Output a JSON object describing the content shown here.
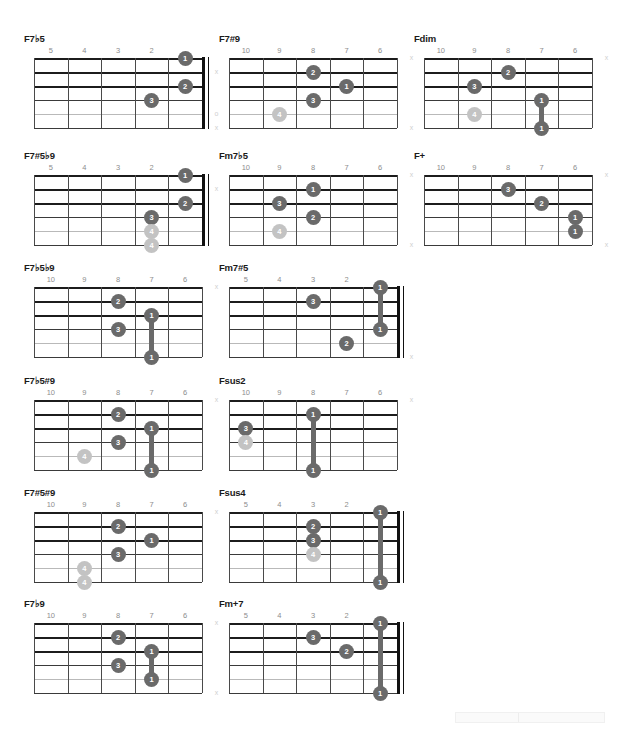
{
  "page": {
    "width": 627,
    "height": 729,
    "background": "#ffffff",
    "dot_color": "#6a6a6a",
    "dot_light_color": "#c3c3c3",
    "line_color": "#3a3a3a",
    "fretnum_color": "#8d8d8d",
    "marker_color": "#cfcfcf"
  },
  "legend": {
    "muted_symbol": "x",
    "open_symbol": "o"
  },
  "chords": [
    {
      "name": "F7♭5",
      "col": 0,
      "row": 0,
      "frets": [
        "5",
        "4",
        "3",
        "2",
        ""
      ],
      "has_nut": true,
      "dots": [
        {
          "string": 1,
          "fret_slot": 4,
          "label": "1",
          "light": false
        },
        {
          "string": 3,
          "fret_slot": 4,
          "label": "2",
          "light": false
        },
        {
          "string": 4,
          "fret_slot": 3,
          "label": "3",
          "light": false
        }
      ],
      "barres": [],
      "markers": [
        {
          "string": 2,
          "symbol": "x"
        },
        {
          "string": 5,
          "symbol": "o"
        },
        {
          "string": 6,
          "symbol": "x"
        }
      ]
    },
    {
      "name": "F7#9",
      "col": 1,
      "row": 0,
      "frets": [
        "10",
        "9",
        "8",
        "7",
        "6"
      ],
      "has_nut": false,
      "dots": [
        {
          "string": 2,
          "fret_slot": 2,
          "label": "2",
          "light": false
        },
        {
          "string": 3,
          "fret_slot": 3,
          "label": "1",
          "light": false
        },
        {
          "string": 4,
          "fret_slot": 2,
          "label": "3",
          "light": false
        },
        {
          "string": 5,
          "fret_slot": 1,
          "label": "4",
          "light": true
        }
      ],
      "barres": [],
      "markers": [
        {
          "string": 1,
          "symbol": "x"
        },
        {
          "string": 6,
          "symbol": "x"
        }
      ]
    },
    {
      "name": "Fdim",
      "col": 2,
      "row": 0,
      "frets": [
        "10",
        "9",
        "8",
        "7",
        "6"
      ],
      "has_nut": false,
      "dots": [
        {
          "string": 2,
          "fret_slot": 2,
          "label": "2",
          "light": false
        },
        {
          "string": 3,
          "fret_slot": 1,
          "label": "3",
          "light": false
        },
        {
          "string": 4,
          "fret_slot": 3,
          "label": "1",
          "light": false
        },
        {
          "string": 5,
          "fret_slot": 1,
          "label": "4",
          "light": true
        },
        {
          "string": 6,
          "fret_slot": 3,
          "label": "1",
          "light": false
        }
      ],
      "barres": [
        {
          "fret_slot": 3,
          "from_string": 4,
          "to_string": 6
        }
      ],
      "markers": [
        {
          "string": 1,
          "symbol": "x"
        }
      ]
    },
    {
      "name": "F7#5♭9",
      "col": 0,
      "row": 1,
      "frets": [
        "5",
        "4",
        "3",
        "2",
        ""
      ],
      "has_nut": true,
      "dots": [
        {
          "string": 1,
          "fret_slot": 4,
          "label": "1",
          "light": false
        },
        {
          "string": 3,
          "fret_slot": 4,
          "label": "2",
          "light": false
        },
        {
          "string": 4,
          "fret_slot": 3,
          "label": "3",
          "light": false
        },
        {
          "string": 5,
          "fret_slot": 3,
          "label": "4",
          "light": true
        },
        {
          "string": 6,
          "fret_slot": 3,
          "label": "4",
          "light": true
        }
      ],
      "barres": [],
      "markers": [
        {
          "string": 2,
          "symbol": "x"
        }
      ]
    },
    {
      "name": "Fm7♭5",
      "col": 1,
      "row": 1,
      "frets": [
        "10",
        "9",
        "8",
        "7",
        "6"
      ],
      "has_nut": false,
      "dots": [
        {
          "string": 2,
          "fret_slot": 2,
          "label": "1",
          "light": false
        },
        {
          "string": 3,
          "fret_slot": 1,
          "label": "3",
          "light": false
        },
        {
          "string": 4,
          "fret_slot": 2,
          "label": "2",
          "light": false
        },
        {
          "string": 5,
          "fret_slot": 1,
          "label": "4",
          "light": true
        }
      ],
      "barres": [],
      "markers": [
        {
          "string": 1,
          "symbol": "x"
        },
        {
          "string": 6,
          "symbol": "x"
        }
      ]
    },
    {
      "name": "F+",
      "col": 2,
      "row": 1,
      "frets": [
        "10",
        "9",
        "8",
        "7",
        "6"
      ],
      "has_nut": false,
      "dots": [
        {
          "string": 2,
          "fret_slot": 2,
          "label": "3",
          "light": false
        },
        {
          "string": 3,
          "fret_slot": 3,
          "label": "2",
          "light": false
        },
        {
          "string": 4,
          "fret_slot": 4,
          "label": "1",
          "light": false
        },
        {
          "string": 5,
          "fret_slot": 4,
          "label": "1",
          "light": false
        }
      ],
      "barres": [],
      "markers": [
        {
          "string": 1,
          "symbol": "x"
        },
        {
          "string": 6,
          "symbol": "x"
        }
      ]
    },
    {
      "name": "F7♭5♭9",
      "col": 0,
      "row": 2,
      "frets": [
        "10",
        "9",
        "8",
        "7",
        "6"
      ],
      "has_nut": false,
      "dots": [
        {
          "string": 2,
          "fret_slot": 2,
          "label": "2",
          "light": false
        },
        {
          "string": 3,
          "fret_slot": 3,
          "label": "1",
          "light": false
        },
        {
          "string": 4,
          "fret_slot": 2,
          "label": "3",
          "light": false
        },
        {
          "string": 6,
          "fret_slot": 3,
          "label": "1",
          "light": false
        }
      ],
      "barres": [
        {
          "fret_slot": 3,
          "from_string": 3,
          "to_string": 6
        }
      ],
      "markers": [
        {
          "string": 1,
          "symbol": "x"
        }
      ]
    },
    {
      "name": "Fm7#5",
      "col": 1,
      "row": 2,
      "frets": [
        "5",
        "4",
        "3",
        "2",
        ""
      ],
      "has_nut": true,
      "dots": [
        {
          "string": 1,
          "fret_slot": 4,
          "label": "1",
          "light": false
        },
        {
          "string": 2,
          "fret_slot": 2,
          "label": "3",
          "light": false
        },
        {
          "string": 4,
          "fret_slot": 4,
          "label": "1",
          "light": false
        },
        {
          "string": 5,
          "fret_slot": 3,
          "label": "2",
          "light": false
        }
      ],
      "barres": [
        {
          "fret_slot": 4,
          "from_string": 1,
          "to_string": 4
        }
      ],
      "markers": [
        {
          "string": 6,
          "symbol": "x"
        }
      ]
    },
    {
      "name": "F7♭5#9",
      "col": 0,
      "row": 3,
      "frets": [
        "10",
        "9",
        "8",
        "7",
        "6"
      ],
      "has_nut": false,
      "dots": [
        {
          "string": 2,
          "fret_slot": 2,
          "label": "2",
          "light": false
        },
        {
          "string": 3,
          "fret_slot": 3,
          "label": "1",
          "light": false
        },
        {
          "string": 4,
          "fret_slot": 2,
          "label": "3",
          "light": false
        },
        {
          "string": 5,
          "fret_slot": 1,
          "label": "4",
          "light": true
        },
        {
          "string": 6,
          "fret_slot": 3,
          "label": "1",
          "light": false
        }
      ],
      "barres": [
        {
          "fret_slot": 3,
          "from_string": 3,
          "to_string": 6
        }
      ],
      "markers": [
        {
          "string": 1,
          "symbol": "x"
        }
      ]
    },
    {
      "name": "Fsus2",
      "col": 1,
      "row": 3,
      "frets": [
        "10",
        "9",
        "8",
        "7",
        "6"
      ],
      "has_nut": false,
      "dots": [
        {
          "string": 2,
          "fret_slot": 2,
          "label": "1",
          "light": false
        },
        {
          "string": 3,
          "fret_slot": 0,
          "label": "3",
          "light": false
        },
        {
          "string": 4,
          "fret_slot": 0,
          "label": "4",
          "light": true
        },
        {
          "string": 6,
          "fret_slot": 2,
          "label": "1",
          "light": false
        }
      ],
      "barres": [
        {
          "fret_slot": 2,
          "from_string": 2,
          "to_string": 6
        }
      ],
      "markers": [
        {
          "string": 1,
          "symbol": "x"
        }
      ]
    },
    {
      "name": "F7#5#9",
      "col": 0,
      "row": 4,
      "frets": [
        "10",
        "9",
        "8",
        "7",
        "6"
      ],
      "has_nut": false,
      "dots": [
        {
          "string": 2,
          "fret_slot": 2,
          "label": "2",
          "light": false
        },
        {
          "string": 3,
          "fret_slot": 3,
          "label": "1",
          "light": false
        },
        {
          "string": 4,
          "fret_slot": 2,
          "label": "3",
          "light": false
        },
        {
          "string": 5,
          "fret_slot": 1,
          "label": "4",
          "light": true
        },
        {
          "string": 6,
          "fret_slot": 1,
          "label": "4",
          "light": true
        }
      ],
      "barres": [],
      "markers": [
        {
          "string": 1,
          "symbol": "x"
        }
      ]
    },
    {
      "name": "Fsus4",
      "col": 1,
      "row": 4,
      "frets": [
        "5",
        "4",
        "3",
        "2",
        ""
      ],
      "has_nut": true,
      "dots": [
        {
          "string": 1,
          "fret_slot": 4,
          "label": "1",
          "light": false
        },
        {
          "string": 2,
          "fret_slot": 2,
          "label": "2",
          "light": false
        },
        {
          "string": 3,
          "fret_slot": 2,
          "label": "3",
          "light": false
        },
        {
          "string": 4,
          "fret_slot": 2,
          "label": "4",
          "light": true
        },
        {
          "string": 6,
          "fret_slot": 4,
          "label": "1",
          "light": false
        }
      ],
      "barres": [
        {
          "fret_slot": 4,
          "from_string": 1,
          "to_string": 6
        }
      ],
      "markers": []
    },
    {
      "name": "F7♭9",
      "col": 0,
      "row": 5,
      "frets": [
        "10",
        "9",
        "8",
        "7",
        "6"
      ],
      "has_nut": false,
      "dots": [
        {
          "string": 2,
          "fret_slot": 2,
          "label": "2",
          "light": false
        },
        {
          "string": 3,
          "fret_slot": 3,
          "label": "1",
          "light": false
        },
        {
          "string": 4,
          "fret_slot": 2,
          "label": "3",
          "light": false
        },
        {
          "string": 5,
          "fret_slot": 3,
          "label": "1",
          "light": false
        }
      ],
      "barres": [
        {
          "fret_slot": 3,
          "from_string": 3,
          "to_string": 5
        }
      ],
      "markers": [
        {
          "string": 1,
          "symbol": "x"
        },
        {
          "string": 6,
          "symbol": "x"
        }
      ]
    },
    {
      "name": "Fm+7",
      "col": 1,
      "row": 5,
      "frets": [
        "5",
        "4",
        "3",
        "2",
        ""
      ],
      "has_nut": true,
      "dots": [
        {
          "string": 1,
          "fret_slot": 4,
          "label": "1",
          "light": false
        },
        {
          "string": 2,
          "fret_slot": 2,
          "label": "3",
          "light": false
        },
        {
          "string": 3,
          "fret_slot": 3,
          "label": "2",
          "light": false
        },
        {
          "string": 6,
          "fret_slot": 4,
          "label": "1",
          "light": false
        }
      ],
      "barres": [
        {
          "fret_slot": 4,
          "from_string": 1,
          "to_string": 6
        }
      ],
      "markers": []
    }
  ]
}
